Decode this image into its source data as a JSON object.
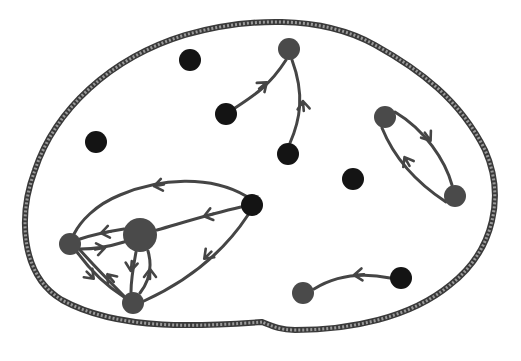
{
  "diagram": {
    "title": "Directed graph of nodes inside a closed boundary",
    "boundary": {
      "style": "hatched-rope",
      "stroke_color": "#3a3a3a",
      "hatch_color": "#9a9a9a",
      "path": "M262,322 C205,326 120,332 62,300 C20,275 18,215 35,170 C55,110 110,58 185,35 C245,18 320,14 375,45 C420,70 460,100 485,150 C505,195 495,250 450,285 C410,318 350,330 295,330 C280,330 272,326 262,322"
    },
    "colors": {
      "black_node": "#141414",
      "gray_node": "#4a4a4a",
      "edge": "#454545"
    },
    "nodes": [
      {
        "id": "n1",
        "x": 190,
        "y": 60,
        "r": 11,
        "color": "black"
      },
      {
        "id": "n2",
        "x": 96,
        "y": 142,
        "r": 11,
        "color": "black"
      },
      {
        "id": "n3",
        "x": 226,
        "y": 114,
        "r": 11,
        "color": "black"
      },
      {
        "id": "n4",
        "x": 289,
        "y": 49,
        "r": 11,
        "color": "gray"
      },
      {
        "id": "n5",
        "x": 288,
        "y": 154,
        "r": 11,
        "color": "black"
      },
      {
        "id": "n6",
        "x": 353,
        "y": 179,
        "r": 11,
        "color": "black"
      },
      {
        "id": "n7",
        "x": 385,
        "y": 117,
        "r": 11,
        "color": "gray"
      },
      {
        "id": "n8",
        "x": 455,
        "y": 196,
        "r": 11,
        "color": "gray"
      },
      {
        "id": "n9",
        "x": 252,
        "y": 205,
        "r": 11,
        "color": "black"
      },
      {
        "id": "n10",
        "x": 140,
        "y": 235,
        "r": 17,
        "color": "gray"
      },
      {
        "id": "n11",
        "x": 70,
        "y": 244,
        "r": 11,
        "color": "gray"
      },
      {
        "id": "n12",
        "x": 133,
        "y": 303,
        "r": 11,
        "color": "gray"
      },
      {
        "id": "n13",
        "x": 401,
        "y": 278,
        "r": 11,
        "color": "black"
      },
      {
        "id": "n14",
        "x": 303,
        "y": 293,
        "r": 11,
        "color": "gray"
      }
    ],
    "edges": [
      {
        "from": "n3",
        "to": "n4",
        "path": "M235,108 C255,95 270,85 286,60",
        "arrow": {
          "x": 266,
          "y": 83,
          "angle": -40
        }
      },
      {
        "from": "n5",
        "to": "n4",
        "path": "M290,143 C300,120 305,95 292,60",
        "arrow": {
          "x": 303,
          "y": 102,
          "angle": -95
        }
      },
      {
        "from": "n7",
        "to": "n8",
        "path": "M395,112 C425,130 445,160 452,185",
        "arrow": {
          "x": 430,
          "y": 140,
          "angle": 55
        }
      },
      {
        "from": "n8",
        "to": "n7",
        "path": "M446,202 C420,185 395,160 382,128",
        "arrow": {
          "x": 405,
          "y": 158,
          "angle": -120
        }
      },
      {
        "from": "n9",
        "to": "n10",
        "path": "M241,207 C210,214 185,222 157,230",
        "arrow": {
          "x": 205,
          "y": 216,
          "angle": 165
        }
      },
      {
        "from": "n9",
        "to": "n11",
        "path": "M246,196 C210,175 160,178 120,195 C95,205 80,222 74,234",
        "arrow": {
          "x": 155,
          "y": 186,
          "angle": 170
        }
      },
      {
        "from": "n9",
        "to": "n12",
        "path": "M248,215 C225,250 190,280 144,301",
        "arrow": {
          "x": 205,
          "y": 258,
          "angle": 135
        }
      },
      {
        "from": "n10",
        "to": "n11",
        "path": "M124,229 C105,232 92,235 80,239",
        "arrow": {
          "x": 102,
          "y": 233,
          "angle": 170
        }
      },
      {
        "from": "n11",
        "to": "n10",
        "path": "M80,249 C95,249 108,247 124,242",
        "arrow": {
          "x": 104,
          "y": 248,
          "angle": -10
        }
      },
      {
        "from": "n10",
        "to": "n12",
        "path": "M136,252 C133,268 131,280 131,292",
        "arrow": {
          "x": 131,
          "y": 270,
          "angle": 95
        }
      },
      {
        "from": "n12",
        "to": "n10",
        "path": "M140,293 C150,280 152,265 148,251",
        "arrow": {
          "x": 150,
          "y": 270,
          "angle": -90
        }
      },
      {
        "from": "n11",
        "to": "n12",
        "path": "M77,252 C90,270 105,285 124,297",
        "arrow": {
          "x": 93,
          "y": 278,
          "angle": 45
        }
      },
      {
        "from": "n12",
        "to": "n11",
        "path": "M124,296 C110,282 96,268 80,250",
        "arrow": {
          "x": 108,
          "y": 275,
          "angle": -130
        }
      },
      {
        "from": "n13",
        "to": "n14",
        "path": "M390,278 C360,272 335,276 314,289",
        "arrow": {
          "x": 355,
          "y": 275,
          "angle": 175
        }
      }
    ]
  }
}
